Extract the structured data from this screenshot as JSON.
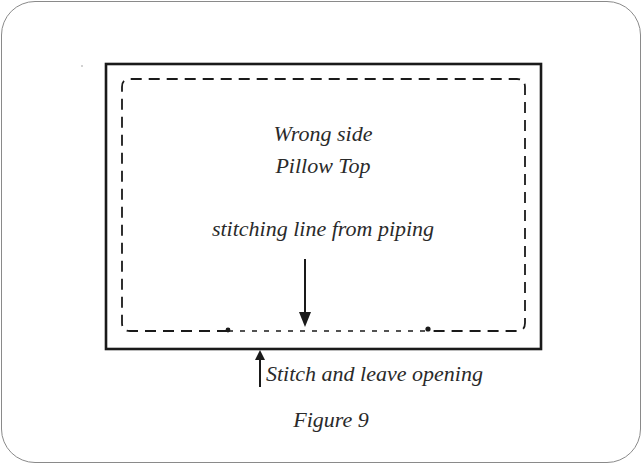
{
  "figure": {
    "inner_label_line1": "Wrong side",
    "inner_label_line2": "Pillow Top",
    "stitching_label": "stitching line from piping",
    "opening_label": "Stitch and leave opening",
    "caption": "Figure 9"
  },
  "icons": {
    "down_arrow": "arrow-down-icon",
    "up_arrow": "arrow-up-icon"
  },
  "colors": {
    "line": "#1a1a1a",
    "text": "#2a2a2a",
    "card_border": "#8a8a8a"
  }
}
